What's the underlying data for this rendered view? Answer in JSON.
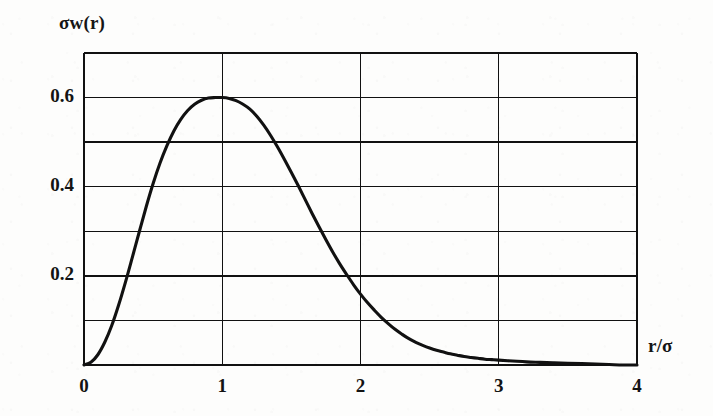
{
  "figure": {
    "background_color": "#fdfdfc",
    "ink_color": "#111111",
    "y_axis_title": "σw(r)",
    "x_axis_title": "r/σ"
  },
  "chart_data": {
    "type": "line",
    "title": "",
    "subtitle": "",
    "xlabel": "r/σ",
    "ylabel": "σw(r)",
    "xlim": [
      0,
      4
    ],
    "ylim": [
      0,
      0.7
    ],
    "grid": true,
    "legend": null,
    "annotations": [],
    "x_tick_labels": [
      "0",
      "1",
      "2",
      "3",
      "4"
    ],
    "x_tick_values": [
      0,
      1,
      2,
      3,
      4
    ],
    "y_tick_labels": [
      "0.2",
      "0.4",
      "0.6"
    ],
    "y_tick_values": [
      0.2,
      0.4,
      0.6
    ],
    "x_gridlines": [
      1,
      2,
      3
    ],
    "y_gridlines": [
      0.1,
      0.2,
      0.3,
      0.4,
      0.5,
      0.6,
      0.7
    ],
    "series": [
      {
        "name": "σw(r)",
        "color": "#111111",
        "x": [
          0.0,
          0.1,
          0.2,
          0.3,
          0.4,
          0.5,
          0.6,
          0.7,
          0.8,
          0.9,
          1.0,
          1.1,
          1.2,
          1.3,
          1.4,
          1.5,
          1.6,
          1.7,
          1.8,
          1.9,
          2.0,
          2.1,
          2.2,
          2.3,
          2.4,
          2.5,
          2.6,
          2.7,
          2.8,
          2.9,
          3.0,
          3.1,
          3.2,
          3.3,
          3.4,
          3.5,
          3.6,
          3.7,
          3.8,
          3.9,
          4.0
        ],
        "values": [
          0.0,
          0.022,
          0.087,
          0.186,
          0.308,
          0.439,
          0.565,
          0.673,
          0.752,
          0.796,
          0.6,
          0.583,
          0.548,
          0.499,
          0.441,
          0.379,
          0.317,
          0.259,
          0.206,
          0.16,
          0.122,
          0.091,
          0.066,
          0.047,
          0.032,
          0.022,
          0.014,
          0.009,
          0.006,
          0.004,
          0.002,
          0.001,
          0.001,
          0.0,
          0.0,
          0.0,
          0.0,
          0.0,
          0.0,
          0.0,
          0.0
        ]
      }
    ],
    "curve_points": [
      [
        0.0,
        0.0
      ],
      [
        0.05,
        0.006
      ],
      [
        0.1,
        0.023
      ],
      [
        0.15,
        0.051
      ],
      [
        0.2,
        0.088
      ],
      [
        0.25,
        0.134
      ],
      [
        0.3,
        0.186
      ],
      [
        0.35,
        0.242
      ],
      [
        0.4,
        0.299
      ],
      [
        0.45,
        0.355
      ],
      [
        0.5,
        0.407
      ],
      [
        0.55,
        0.453
      ],
      [
        0.6,
        0.492
      ],
      [
        0.65,
        0.525
      ],
      [
        0.7,
        0.551
      ],
      [
        0.75,
        0.571
      ],
      [
        0.8,
        0.585
      ],
      [
        0.85,
        0.594
      ],
      [
        0.9,
        0.599
      ],
      [
        0.95,
        0.6
      ],
      [
        1.0,
        0.6
      ],
      [
        1.05,
        0.598
      ],
      [
        1.1,
        0.593
      ],
      [
        1.15,
        0.585
      ],
      [
        1.2,
        0.574
      ],
      [
        1.25,
        0.558
      ],
      [
        1.3,
        0.538
      ],
      [
        1.35,
        0.515
      ],
      [
        1.4,
        0.489
      ],
      [
        1.45,
        0.461
      ],
      [
        1.5,
        0.432
      ],
      [
        1.55,
        0.402
      ],
      [
        1.6,
        0.371
      ],
      [
        1.65,
        0.34
      ],
      [
        1.7,
        0.31
      ],
      [
        1.75,
        0.281
      ],
      [
        1.8,
        0.253
      ],
      [
        1.85,
        0.227
      ],
      [
        1.9,
        0.203
      ],
      [
        1.95,
        0.18
      ],
      [
        2.0,
        0.159
      ],
      [
        2.05,
        0.14
      ],
      [
        2.1,
        0.123
      ],
      [
        2.15,
        0.107
      ],
      [
        2.2,
        0.093
      ],
      [
        2.25,
        0.08
      ],
      [
        2.3,
        0.069
      ],
      [
        2.35,
        0.059
      ],
      [
        2.4,
        0.051
      ],
      [
        2.45,
        0.044
      ],
      [
        2.5,
        0.038
      ],
      [
        2.55,
        0.033
      ],
      [
        2.6,
        0.029
      ],
      [
        2.65,
        0.025
      ],
      [
        2.7,
        0.022
      ],
      [
        2.75,
        0.019
      ],
      [
        2.8,
        0.017
      ],
      [
        2.85,
        0.015
      ],
      [
        2.9,
        0.013
      ],
      [
        2.95,
        0.012
      ],
      [
        3.0,
        0.011
      ],
      [
        3.1,
        0.009
      ],
      [
        3.2,
        0.007
      ],
      [
        3.3,
        0.006
      ],
      [
        3.4,
        0.005
      ],
      [
        3.5,
        0.004
      ],
      [
        3.6,
        0.003
      ],
      [
        3.7,
        0.002
      ],
      [
        3.8,
        0.001
      ],
      [
        3.9,
        0.0
      ],
      [
        4.0,
        0.0
      ]
    ]
  }
}
